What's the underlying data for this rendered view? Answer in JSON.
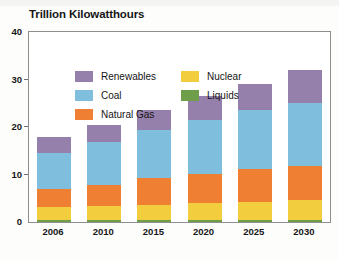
{
  "chart_data": {
    "type": "bar",
    "subtype": "stacked-bar",
    "title": "Trillion Kilowatthours",
    "xlabel": "",
    "ylabel": "",
    "ylim": [
      0,
      40
    ],
    "yticks": [
      0,
      10,
      20,
      30,
      40
    ],
    "ytick_labels": [
      "0",
      "10",
      "20",
      "30",
      "40"
    ],
    "grid": false,
    "legend_position": "top-left-inside",
    "categories": [
      "2006",
      "2010",
      "2015",
      "2020",
      "2025",
      "2030"
    ],
    "series": [
      {
        "name": "Liquids",
        "color": "#6f9e4a",
        "values": [
          0.4,
          0.4,
          0.4,
          0.4,
          0.4,
          0.4
        ]
      },
      {
        "name": "Nuclear",
        "color": "#f2ce3e",
        "values": [
          2.7,
          2.9,
          3.2,
          3.6,
          3.9,
          4.2
        ]
      },
      {
        "name": "Natural Gas",
        "color": "#ef8033",
        "values": [
          3.8,
          4.5,
          5.6,
          6.1,
          6.9,
          7.3
        ]
      },
      {
        "name": "Coal",
        "color": "#80bedd",
        "values": [
          7.7,
          9.0,
          10.2,
          11.4,
          12.3,
          13.1
        ]
      },
      {
        "name": "Renewables",
        "color": "#9580ab",
        "values": [
          3.4,
          3.7,
          4.1,
          5.0,
          5.5,
          7.0
        ]
      }
    ],
    "totals": [
      18.0,
      20.5,
      23.5,
      26.5,
      29.0,
      32.0
    ]
  },
  "legend": {
    "entries": [
      {
        "label": "Renewables",
        "color": "#9580ab",
        "column": "left"
      },
      {
        "label": "Coal",
        "color": "#80bedd",
        "column": "left"
      },
      {
        "label": "Natural Gas",
        "color": "#ef8033",
        "column": "left"
      },
      {
        "label": "Nuclear",
        "color": "#f2ce3e",
        "column": "right"
      },
      {
        "label": "Liquids",
        "color": "#6f9e4a",
        "column": "right"
      }
    ]
  },
  "colors": {
    "renewables": "#9580ab",
    "coal": "#80bedd",
    "natural_gas": "#ef8033",
    "nuclear": "#f2ce3e",
    "liquids": "#6f9e4a",
    "axis": "#8e8e8e",
    "text": "#161616",
    "background": "#ffffff"
  }
}
